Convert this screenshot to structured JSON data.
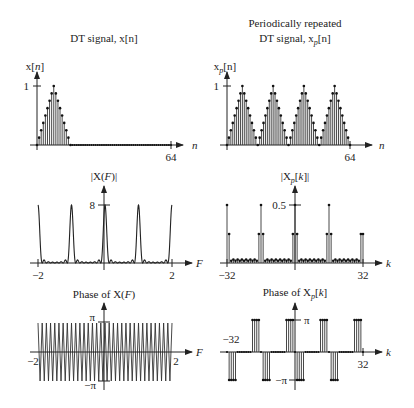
{
  "chart_data": [
    {
      "type": "stem",
      "panel": "top-left",
      "title": "DT signal, x[n]",
      "ylabel": "x[n]",
      "xlabel": "n",
      "xticks": [
        {
          "value": 64,
          "label": "64"
        }
      ],
      "yticks": [
        {
          "value": 1,
          "label": "1"
        }
      ],
      "xlim": [
        0,
        64
      ],
      "ylim": [
        0,
        1
      ],
      "description": "Triangular pulse: x[n] = 1 - |n-8|/8 for 0<=n<=16, 0 for 16<n<=64",
      "n_range": [
        0,
        64
      ],
      "pulse_length": 16
    },
    {
      "type": "stem",
      "panel": "top-right",
      "title": "Periodically repeated DT signal, x_p[n]",
      "title_lines": [
        "Periodically repeated",
        "DT signal, x_p[n]"
      ],
      "ylabel": "x_p[n]",
      "xlabel": "n",
      "xticks": [
        {
          "value": 64,
          "label": "64"
        }
      ],
      "yticks": [
        {
          "value": 1,
          "label": "1"
        }
      ],
      "xlim": [
        0,
        64
      ],
      "ylim": [
        0,
        1
      ],
      "description": "Triangular pulse repeated with period 16 (4 periods shown)",
      "period": 16
    },
    {
      "type": "line",
      "panel": "middle-left",
      "title": "|X(F)|",
      "xlabel": "F",
      "xticks": [
        {
          "value": -2,
          "label": "−2"
        },
        {
          "value": 2,
          "label": "2"
        }
      ],
      "yticks": [
        {
          "value": 8,
          "label": "8"
        }
      ],
      "xlim": [
        -2,
        2
      ],
      "ylim": [
        0,
        8
      ],
      "description": "DTFT magnitude of triangle: narrow peaks of height 8 at integer F, small sidelobes between",
      "peaks_at": [
        -2,
        -1,
        0,
        1,
        2
      ],
      "peak_height": 8
    },
    {
      "type": "stem",
      "panel": "middle-right",
      "title": "|X_p[k]|",
      "xlabel": "k",
      "xticks": [
        {
          "value": -32,
          "label": "−32"
        },
        {
          "value": 32,
          "label": "32"
        }
      ],
      "yticks": [
        {
          "value": 0.5,
          "label": "0.5"
        }
      ],
      "xlim": [
        -32,
        32
      ],
      "ylim": [
        0,
        0.5
      ],
      "description": "DFT magnitude: peaks of 0.5 at k=-32,-16,0,16 with neighbors ~0.25; k=32 ~0.25; small values elsewhere",
      "peaks": [
        {
          "k": -32,
          "value": 0.5
        },
        {
          "k": -16,
          "value": 0.5
        },
        {
          "k": 0,
          "value": 0.5
        },
        {
          "k": 16,
          "value": 0.5
        },
        {
          "k": 32,
          "value": 0.25
        }
      ]
    },
    {
      "type": "line",
      "panel": "bottom-left",
      "title": "Phase of X(F)",
      "xlabel": "F",
      "xticks": [
        {
          "value": -2,
          "label": "−2"
        },
        {
          "value": 2,
          "label": "2"
        }
      ],
      "yticks": [
        {
          "value": 3.1416,
          "label": "π"
        },
        {
          "value": -3.1416,
          "label": "−π"
        }
      ],
      "xlim": [
        -2,
        2
      ],
      "ylim": [
        -3.1416,
        3.1416
      ],
      "description": "Linear phase wrapping rapidly between -pi and pi (sawtooth)",
      "wraps": 32
    },
    {
      "type": "stem",
      "panel": "bottom-right",
      "title": "Phase of X_p[k]",
      "xlabel": "k",
      "xticks": [
        {
          "value": -32,
          "label": "−32"
        },
        {
          "value": 32,
          "label": "32"
        }
      ],
      "yticks": [
        {
          "value": 3.1416,
          "label": "π"
        },
        {
          "value": -3.1416,
          "label": "−π"
        }
      ],
      "xlim": [
        -32,
        32
      ],
      "ylim": [
        -3.1416,
        3.1416
      ],
      "description": "Phase stems alternate in groups of 4: -pi groups then +pi groups, period 16"
    }
  ],
  "labels": {
    "tl_title": "DT signal, x[n]",
    "tr_title_1": "Periodically repeated",
    "tr_title_2": "DT signal, x",
    "tr_title_sub": "p",
    "tr_title_end": "[n]",
    "tl_ylabel": "x[",
    "tl_ylabel_n": "n",
    "tl_ylabel_end": "]",
    "tr_ylabel": "x",
    "tr_ylabel_sub": "p",
    "tr_ylabel_end": "[n]",
    "ml_title": "|X(F)|",
    "mr_title": "|X",
    "mr_title_sub": "p",
    "mr_title_end": "[k]|",
    "bl_title": "Phase of X(F)",
    "br_title": "Phase of X",
    "br_title_sub": "p",
    "br_title_end": "[k]",
    "one": "1",
    "n": "n",
    "k": "k",
    "F": "F",
    "n64": "64",
    "eight": "8",
    "half": "0.5",
    "neg2": "−2",
    "pos2": "2",
    "neg32": "−32",
    "pos32": "32",
    "pi": "π",
    "negpi": "−π"
  }
}
